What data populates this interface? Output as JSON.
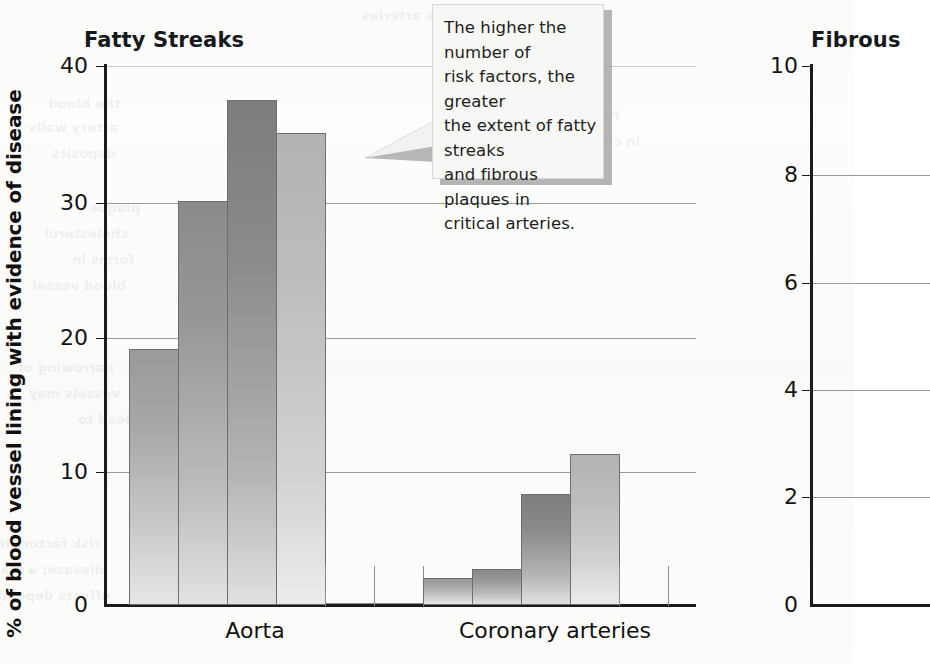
{
  "figure": {
    "background_color": "#fbfbfa",
    "bar_outline_color": "#6e6e6e"
  },
  "callout": {
    "name": "annotation-callout",
    "text": "The higher the number of risk factors, the greater the extent of fatty streaks and fibrous plaques in critical arteries.",
    "lines": [
      "The higher the number of",
      "risk factors, the greater",
      "the extent of fatty streaks",
      "and fibrous plaques in",
      "critical arteries."
    ],
    "background_color": "#f7f7f5",
    "shadow_color": "#a8a8a8",
    "points_at": "Aorta 4-risk-factor bar"
  },
  "charts": [
    {
      "id": "fatty-streaks",
      "title": "Fatty Streaks",
      "ylabel": "% of blood vessel lining with evidence of disease",
      "yticks": [
        "0",
        "10",
        "20",
        "30",
        "40"
      ],
      "categories": [
        "Aorta",
        "Coronary arteries"
      ]
    },
    {
      "id": "fibrous-plaques",
      "title": "Fibrous",
      "title_full": "Fibrous Plaques",
      "yticks": [
        "0",
        "2",
        "4",
        "6",
        "8",
        "10"
      ],
      "categories": []
    }
  ],
  "chart_data": [
    {
      "type": "bar",
      "id": "fatty-streaks",
      "title": "Fatty Streaks",
      "xlabel": "",
      "ylabel": "% of blood vessel lining with evidence of disease",
      "ylim": [
        0,
        40
      ],
      "yticks": [
        0,
        10,
        20,
        30,
        40
      ],
      "grid": true,
      "legend": "none",
      "categories": [
        "Aorta",
        "Coronary arteries"
      ],
      "series": [
        {
          "name": "0 risk factors",
          "values": [
            19,
            2
          ]
        },
        {
          "name": "1 risk factor",
          "values": [
            30,
            2.7
          ]
        },
        {
          "name": "2 risk factors",
          "values": [
            37.5,
            8.2
          ]
        },
        {
          "name": "3+ risk factors",
          "values": [
            35,
            11.2
          ]
        }
      ],
      "bars": [
        {
          "group": "Aorta",
          "index": 0,
          "value": 19
        },
        {
          "group": "Aorta",
          "index": 1,
          "value": 30
        },
        {
          "group": "Aorta",
          "index": 2,
          "value": 37.5
        },
        {
          "group": "Aorta",
          "index": 3,
          "value": 35
        },
        {
          "group": "Coronary arteries",
          "index": 0,
          "value": 2
        },
        {
          "group": "Coronary arteries",
          "index": 1,
          "value": 2.7
        },
        {
          "group": "Coronary arteries",
          "index": 2,
          "value": 8.2
        },
        {
          "group": "Coronary arteries",
          "index": 3,
          "value": 11.2
        }
      ],
      "annotation": "The higher the number of risk factors, the greater the extent of fatty streaks and fibrous plaques in critical arteries."
    },
    {
      "type": "bar",
      "id": "fibrous-plaques",
      "title": "Fibrous",
      "xlabel": "",
      "ylabel": "",
      "ylim": [
        0,
        10
      ],
      "yticks": [
        0,
        2,
        4,
        6,
        8,
        10
      ],
      "grid": true,
      "legend": "none",
      "note": "Chart is cut off at the right edge of the screenshot; no bars visible.",
      "categories": [],
      "series": []
    }
  ],
  "ghost_text": [
    {
      "t": "of the arteries",
      "x": 470,
      "y": 8
    },
    {
      "t": "the blood",
      "x": 120,
      "y": 96
    },
    {
      "t": "artery walls",
      "x": 118,
      "y": 120
    },
    {
      "t": "deposits",
      "x": 116,
      "y": 146
    },
    {
      "t": "plaque",
      "x": 140,
      "y": 200
    },
    {
      "t": "cholesterol",
      "x": 128,
      "y": 226
    },
    {
      "t": "forms in",
      "x": 134,
      "y": 252
    },
    {
      "t": "blood vessel",
      "x": 126,
      "y": 278
    },
    {
      "t": "narrowing of",
      "x": 114,
      "y": 360
    },
    {
      "t": "vessels may",
      "x": 120,
      "y": 386
    },
    {
      "t": "lead to",
      "x": 130,
      "y": 412
    },
    {
      "t": "risk factors increase the chance of developing",
      "x": 100,
      "y": 536
    },
    {
      "t": "disease; a major cause of death in the world",
      "x": 104,
      "y": 562
    },
    {
      "t": "effects depend on the arteries affected",
      "x": 110,
      "y": 588
    },
    {
      "t": "Fatty streaks begin",
      "x": 620,
      "y": 108
    },
    {
      "t": "in childhood",
      "x": 640,
      "y": 134
    }
  ]
}
